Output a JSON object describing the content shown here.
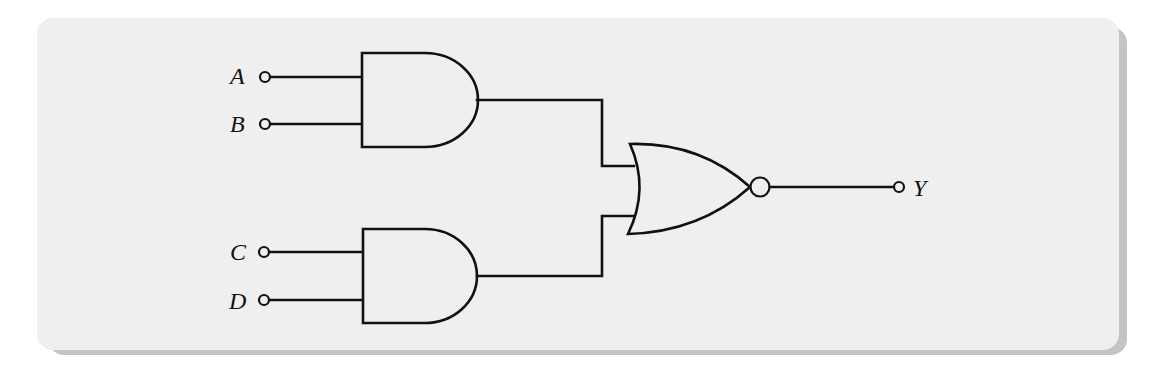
{
  "diagram": {
    "type": "logic-circuit",
    "inputs": [
      {
        "id": "A",
        "label": "A"
      },
      {
        "id": "B",
        "label": "B"
      },
      {
        "id": "C",
        "label": "C"
      },
      {
        "id": "D",
        "label": "D"
      }
    ],
    "output": {
      "id": "Y",
      "label": "Y"
    },
    "gates": [
      {
        "id": "and1",
        "kind": "AND",
        "inputs": [
          "A",
          "B"
        ]
      },
      {
        "id": "and2",
        "kind": "AND",
        "inputs": [
          "C",
          "D"
        ]
      },
      {
        "id": "nor1",
        "kind": "NOR",
        "inputs": [
          "and1",
          "and2"
        ],
        "output": "Y"
      }
    ],
    "colors": {
      "stroke": "#111111",
      "panel": "#efefef",
      "shadow": "#c4c4c4",
      "background": "#ffffff"
    }
  }
}
